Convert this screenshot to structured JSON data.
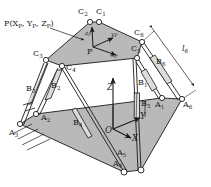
{
  "figure": {
    "type": "line-diagram",
    "width": 211,
    "height": 187,
    "background_color": "#ffffff",
    "platform_fill": "#b8b8b8",
    "line_color": "#1a1a1a"
  },
  "labels": {
    "pose_vector": "P(X",
    "pose_vector_sub1": "P",
    "pose_vector_mid": ", Y",
    "pose_vector_sub2": "P",
    "pose_vector_mid2": ", Z",
    "pose_vector_sub3": "P",
    "pose_vector_end": ")",
    "point_p": "P",
    "origin_o": "O",
    "base_axis_x": "X",
    "base_axis_y": "Y",
    "base_axis_z": "Z",
    "plat_axis_xp": "x",
    "plat_axis_xp_sub": "P",
    "plat_axis_yp": "y",
    "plat_axis_yp_sub": "P",
    "plat_axis_zp": "z",
    "plat_axis_zp_sub": "P",
    "leg_length_l6": "l",
    "leg_length_l6_sub": "6"
  },
  "base_joints": [
    {
      "id": "A1",
      "letter": "A",
      "index": "1",
      "label_x": 161,
      "label_y": 106,
      "joint_x": 162,
      "joint_y": 98
    },
    {
      "id": "A2",
      "letter": "A",
      "index": "2",
      "label_x": 40,
      "label_y": 117,
      "joint_x": 36,
      "joint_y": 114
    },
    {
      "id": "A3",
      "letter": "A",
      "index": "3",
      "label_x": 12,
      "label_y": 131,
      "joint_x": 20,
      "joint_y": 124
    },
    {
      "id": "A4",
      "letter": "A",
      "index": "4",
      "label_x": 117,
      "label_y": 164,
      "joint_x": 124,
      "joint_y": 172
    },
    {
      "id": "A5",
      "letter": "A",
      "index": "5",
      "label_x": 121,
      "label_y": 154,
      "joint_x": 141,
      "joint_y": 170
    },
    {
      "id": "A6",
      "letter": "A",
      "index": "6",
      "label_x": 188,
      "label_y": 105,
      "joint_x": 182,
      "joint_y": 99
    }
  ],
  "platform_joints": [
    {
      "id": "C1",
      "letter": "C",
      "index": "1",
      "label_x": 96,
      "label_y": 13,
      "joint_x": 99,
      "joint_y": 22
    },
    {
      "id": "C2",
      "letter": "C",
      "index": "2",
      "label_x": 78,
      "label_y": 13,
      "joint_x": 90,
      "joint_y": 22
    },
    {
      "id": "C3",
      "letter": "C",
      "index": "3",
      "label_x": 38,
      "label_y": 53,
      "joint_x": 46,
      "joint_y": 60
    },
    {
      "id": "C4",
      "letter": "C",
      "index": "4",
      "label_x": 64,
      "label_y": 68,
      "joint_x": 62,
      "joint_y": 66
    },
    {
      "id": "C5",
      "letter": "C",
      "index": "5",
      "label_x": 133,
      "label_y": 48,
      "joint_x": 137,
      "joint_y": 58
    },
    {
      "id": "C6",
      "letter": "C",
      "index": "6",
      "label_x": 136,
      "label_y": 33,
      "joint_x": 142,
      "joint_y": 42
    }
  ],
  "legs": [
    {
      "id": "B1",
      "letter": "B",
      "index": "1",
      "label_x": 141,
      "label_y": 84
    },
    {
      "id": "B2",
      "letter": "B",
      "index": "2",
      "label_x": 54,
      "label_y": 86
    },
    {
      "id": "B3",
      "letter": "B",
      "index": "3",
      "label_x": 30,
      "label_y": 89
    },
    {
      "id": "B4",
      "letter": "B",
      "index": "4",
      "label_x": 77,
      "label_y": 124
    },
    {
      "id": "B5",
      "letter": "B",
      "index": "5",
      "label_x": 145,
      "label_y": 105
    },
    {
      "id": "B6",
      "letter": "B",
      "index": "6",
      "label_x": 159,
      "label_y": 63
    }
  ],
  "dimension": {
    "id": "l6",
    "label_x": 188,
    "label_y": 50
  },
  "ground": {
    "name": "ground-hatching",
    "hatch_count": 4
  }
}
